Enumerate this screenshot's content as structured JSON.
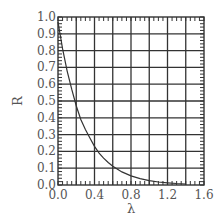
{
  "chart_data": {
    "type": "line",
    "title": "",
    "xlabel": "λ",
    "ylabel": "R",
    "xlim": [
      0.0,
      1.6
    ],
    "ylim": [
      0.0,
      1.0
    ],
    "grid": true,
    "legend": "none",
    "x_ticks": [
      "0.0",
      "0.4",
      "0.8",
      "1.2",
      "1.6"
    ],
    "x_tick_values": [
      0.0,
      0.4,
      0.8,
      1.2,
      1.6
    ],
    "x_grid_values": [
      0.2,
      0.4,
      0.6,
      0.8,
      1.0,
      1.2,
      1.4
    ],
    "x_minor_step": 0.05,
    "y_ticks": [
      "0.0",
      "0.1",
      "0.2",
      "0.3",
      "0.4",
      "0.5",
      "0.6",
      "0.7",
      "0.8",
      "0.9",
      "1.0"
    ],
    "y_tick_values": [
      0.0,
      0.1,
      0.2,
      0.3,
      0.4,
      0.5,
      0.6,
      0.7,
      0.8,
      0.9,
      1.0
    ],
    "y_grid_values": [
      0.1,
      0.2,
      0.3,
      0.4,
      0.5,
      0.6,
      0.7,
      0.8,
      0.9
    ],
    "y_minor_step": 0.02,
    "series": [
      {
        "name": "R(λ)",
        "x": [
          0.0,
          0.05,
          0.1,
          0.15,
          0.2,
          0.25,
          0.3,
          0.35,
          0.4,
          0.45,
          0.5,
          0.55,
          0.6,
          0.7,
          0.8,
          0.9,
          1.0,
          1.1,
          1.2,
          1.3,
          1.4
        ],
        "y": [
          0.97,
          0.81,
          0.68,
          0.57,
          0.47,
          0.39,
          0.33,
          0.28,
          0.23,
          0.19,
          0.16,
          0.134,
          0.112,
          0.078,
          0.054,
          0.038,
          0.026,
          0.018,
          0.013,
          0.009,
          0.006
        ]
      }
    ]
  }
}
